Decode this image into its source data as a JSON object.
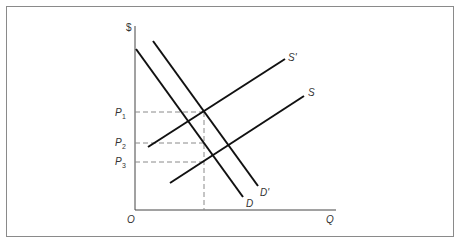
{
  "figure": {
    "type": "supply-demand-shift",
    "axes": {
      "y_label": "$",
      "x_label": "Q",
      "origin_label": "O"
    },
    "price_levels": [
      {
        "id": "p1",
        "label": "P",
        "sub": "1"
      },
      {
        "id": "p2",
        "label": "P",
        "sub": "2"
      },
      {
        "id": "p3",
        "label": "P",
        "sub": "3"
      }
    ],
    "curves": [
      {
        "id": "D",
        "label": "D",
        "kind": "demand"
      },
      {
        "id": "D_prime",
        "label": "D'",
        "kind": "demand"
      },
      {
        "id": "S",
        "label": "S",
        "kind": "supply"
      },
      {
        "id": "S_prime",
        "label": "S'",
        "kind": "supply"
      }
    ],
    "colors": {
      "line": "#111111",
      "dashed": "#8a8a8a",
      "frame": "#8a8a8a",
      "text": "#333333"
    }
  }
}
